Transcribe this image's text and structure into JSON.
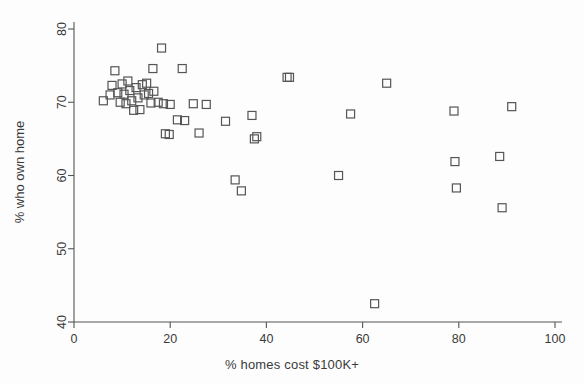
{
  "chart_data": {
    "type": "scatter",
    "title": "",
    "subtitle": "",
    "xlabel": "% homes cost $100K+",
    "ylabel": "% who own home",
    "xlim": [
      0,
      100
    ],
    "ylim": [
      40,
      80
    ],
    "xticks": [
      0,
      20,
      40,
      60,
      80,
      100
    ],
    "yticks": [
      40,
      50,
      60,
      70,
      80
    ],
    "grid": false,
    "legend": null,
    "marker": {
      "shape": "square-open",
      "size": 8,
      "edge_color": "#555555",
      "fill_color": "none",
      "line_width": 1.2
    },
    "series": [
      {
        "name": "states",
        "points": [
          [
            6.1,
            70.2
          ],
          [
            7.5,
            71.0
          ],
          [
            7.9,
            72.3
          ],
          [
            8.5,
            74.3
          ],
          [
            9.1,
            71.3
          ],
          [
            9.6,
            70.0
          ],
          [
            10.0,
            72.5
          ],
          [
            10.4,
            71.1
          ],
          [
            10.8,
            69.8
          ],
          [
            11.2,
            72.9
          ],
          [
            11.6,
            71.6
          ],
          [
            12.0,
            70.2
          ],
          [
            12.4,
            68.9
          ],
          [
            12.9,
            72.0
          ],
          [
            13.3,
            70.6
          ],
          [
            13.7,
            69.0
          ],
          [
            14.2,
            72.4
          ],
          [
            14.6,
            71.0
          ],
          [
            15.1,
            72.6
          ],
          [
            15.5,
            71.2
          ],
          [
            16.0,
            69.9
          ],
          [
            16.4,
            74.6
          ],
          [
            16.6,
            71.5
          ],
          [
            17.5,
            70.0
          ],
          [
            18.2,
            77.4
          ],
          [
            18.6,
            69.8
          ],
          [
            19.0,
            65.7
          ],
          [
            19.8,
            65.6
          ],
          [
            20.0,
            69.7
          ],
          [
            21.5,
            67.6
          ],
          [
            22.5,
            74.6
          ],
          [
            23.0,
            67.5
          ],
          [
            24.8,
            69.8
          ],
          [
            26.0,
            65.8
          ],
          [
            27.5,
            69.7
          ],
          [
            31.5,
            67.4
          ],
          [
            33.5,
            59.4
          ],
          [
            34.8,
            57.9
          ],
          [
            37.0,
            68.2
          ],
          [
            37.5,
            65.0
          ],
          [
            38.0,
            65.3
          ],
          [
            44.3,
            73.4
          ],
          [
            44.8,
            73.4
          ],
          [
            55.0,
            60.0
          ],
          [
            57.5,
            68.4
          ],
          [
            62.5,
            42.5
          ],
          [
            65.0,
            72.6
          ],
          [
            79.0,
            68.8
          ],
          [
            79.2,
            61.9
          ],
          [
            79.5,
            58.3
          ],
          [
            88.5,
            62.6
          ],
          [
            89.0,
            55.6
          ],
          [
            91.0,
            69.4
          ]
        ]
      }
    ],
    "xtick_labels": [
      "0",
      "20",
      "40",
      "60",
      "80",
      "100"
    ],
    "ytick_labels": [
      "40",
      "50",
      "60",
      "70",
      "80"
    ]
  },
  "colors": {
    "marker_edge": "#555555",
    "axis": "#555555",
    "text": "#3a3a3a",
    "background": "#fdfdfd"
  }
}
